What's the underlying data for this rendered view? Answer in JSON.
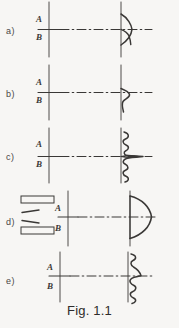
{
  "figure": {
    "caption": "Fig. 1.1",
    "background_color": "#f7f6f4",
    "ink_color": "#3a3836"
  },
  "panels": [
    {
      "label": "a)",
      "top_label": "A",
      "bottom_label": "B",
      "profile_name": "narrow-pointed-spike-profile",
      "has_wall_blocks": false
    },
    {
      "label": "b)",
      "top_label": "A",
      "bottom_label": "B",
      "profile_name": "asymmetric-hook-profile",
      "has_wall_blocks": false
    },
    {
      "label": "c)",
      "top_label": "A",
      "bottom_label": "B",
      "profile_name": "turbulent-spiky-peak-profile",
      "has_wall_blocks": false
    },
    {
      "label": "d)",
      "top_label": "A",
      "bottom_label": "B",
      "profile_name": "blunt-parabolic-profile",
      "has_wall_blocks": true
    },
    {
      "label": "e)",
      "top_label": "A",
      "bottom_label": "B",
      "profile_name": "narrow-turbulent-spike-profile",
      "has_wall_blocks": false
    }
  ]
}
